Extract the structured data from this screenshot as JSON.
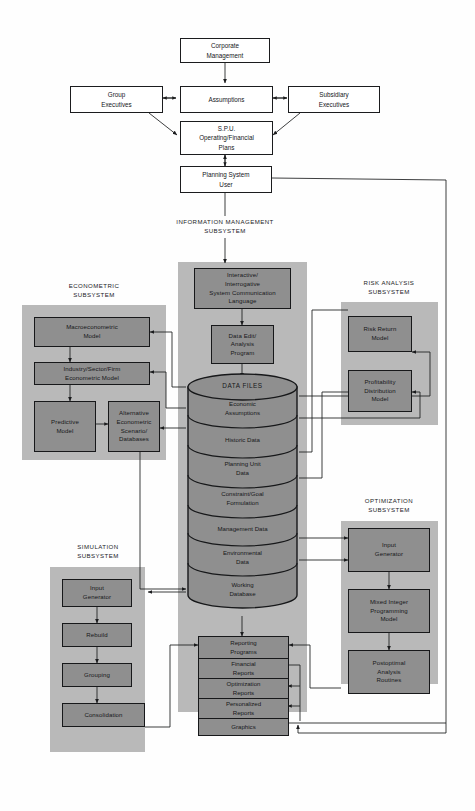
{
  "diagram": {
    "colors": {
      "panel_gray": "#b9b9b9",
      "node_gray": "#8f8f8f",
      "line": "#1b1c1e",
      "background": "#ffffff"
    }
  },
  "top_flow": {
    "corporate_management": "Corporate\nManagement",
    "group_executives": "Group\nExecutives",
    "assumptions": "Assumptions",
    "subsidiary_executives": "Subsidiary\nExecutives",
    "spu_plans": "S.P.U.\nOperating/Financial\nPlans",
    "planning_system_user": "Planning System\nUser"
  },
  "captions": {
    "information_management": "INFORMATION MANAGEMENT\nSUBSYSTEM",
    "econometric": "ECONOMETRIC\nSUBSYSTEM",
    "risk_analysis": "RISK ANALYSIS\nSUBSYSTEM",
    "optimization": "OPTIMIZATION\nSUBSYSTEM",
    "simulation": "SIMULATION\nSUBSYSTEM"
  },
  "information_management": {
    "comm_language": "Interactive/\nInterrogative\nSystem Communication\nLanguage",
    "data_edit": "Data Edit/\nAnalysis\nProgram",
    "data_files_title": "DATA FILES",
    "data_files": [
      "Economic\nAssumptions",
      "Historic Data",
      "Planning Unit\nData",
      "Constraint/Goal\nFormulation",
      "Management Data",
      "Environmental\nData",
      "Working\nDatabase"
    ],
    "reporting_programs": "Reporting\nPrograms",
    "reports": [
      "Financial\nReports",
      "Optimization\nReports",
      "Personalized\nReports",
      "Graphics"
    ]
  },
  "econometric": {
    "nodes": [
      "Macroeconometric\nModel",
      "Industry/Sector/Firm\nEconometric Model",
      "Predictive\nModel",
      "Alternative\nEconometric\nScenario/\nDatabases"
    ]
  },
  "risk_analysis": {
    "nodes": [
      "Risk Return\nModel",
      "Profitability\nDistribution\nModel"
    ]
  },
  "optimization": {
    "nodes": [
      "Input\nGenerator",
      "Mixed Integer\nProgramming\nModel",
      "Postoptimal\nAnalysis\nRoutines"
    ]
  },
  "simulation": {
    "nodes": [
      "Input\nGenerator",
      "Rebuild",
      "Grouping",
      "Consolidation"
    ]
  }
}
